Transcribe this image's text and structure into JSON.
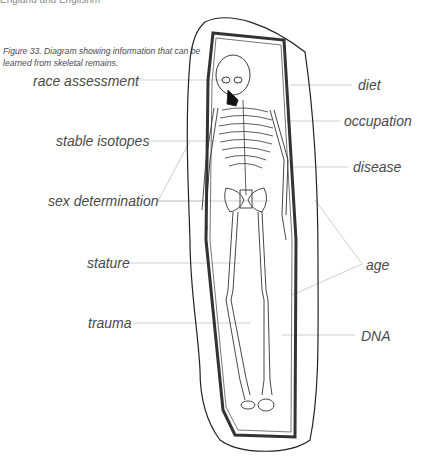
{
  "page": {
    "header_fragment": "England and Englishm",
    "caption": "Figure 33. Diagram showing information that can be learned from skeletal remains."
  },
  "diagram": {
    "labels_left": [
      {
        "text": "race assessment",
        "x": 33,
        "y": 73
      },
      {
        "text": "stable isotopes",
        "x": 56,
        "y": 133
      },
      {
        "text": "sex determination",
        "x": 48,
        "y": 193
      },
      {
        "text": "stature",
        "x": 87,
        "y": 255
      },
      {
        "text": "trauma",
        "x": 88,
        "y": 315
      }
    ],
    "labels_right": [
      {
        "text": "diet",
        "x": 358,
        "y": 80
      },
      {
        "text": "occupation",
        "x": 344,
        "y": 113
      },
      {
        "text": "disease",
        "x": 353,
        "y": 160
      },
      {
        "text": "age",
        "x": 366,
        "y": 257
      },
      {
        "text": "DNA",
        "x": 361,
        "y": 329
      }
    ]
  }
}
